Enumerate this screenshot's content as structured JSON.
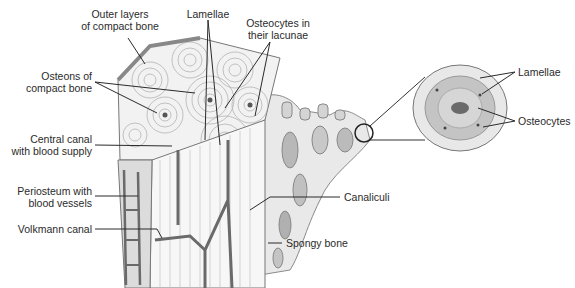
{
  "diagram": {
    "labels": {
      "outer_layers": [
        "Outer layers",
        "of compact bone"
      ],
      "lamellae_top": "Lamellae",
      "osteocytes_lacunae": [
        "Osteocytes in",
        "their lacunae"
      ],
      "osteons": [
        "Osteons of",
        "compact bone"
      ],
      "central_canal": [
        "Central canal",
        "with blood supply"
      ],
      "periosteum": [
        "Periosteum with",
        "blood vessels"
      ],
      "volkmann": "Volkmann canal",
      "canaliculi": "Canaliculi",
      "spongy_bone": "Spongy bone",
      "inset_lamellae": "Lamellae",
      "inset_osteocytes": "Osteocytes"
    },
    "colors": {
      "line": "#2a2a2a",
      "bone_light": "#e6e6e6",
      "bone_mid": "#bdbdbd",
      "vessel": "#6a6a6a"
    }
  }
}
